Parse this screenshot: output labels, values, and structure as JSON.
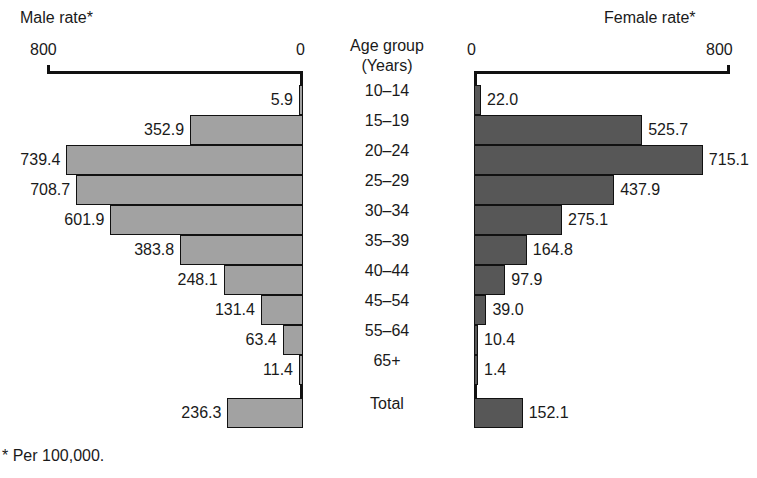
{
  "male_panel": {
    "title": "Male rate*",
    "axis_max_label": "800",
    "axis_zero_label": "0"
  },
  "female_panel": {
    "title": "Female rate*",
    "axis_zero_label": "0",
    "axis_max_label": "800"
  },
  "center": {
    "header_line1": "Age group",
    "header_line2": "(Years)"
  },
  "footnote": "* Per 100,000.",
  "colors": {
    "male_bar": "#a2a2a2",
    "female_bar": "#575757",
    "outline": "#111111",
    "text": "#1a1a1a"
  },
  "chart_data": {
    "type": "bar",
    "orientation": "horizontal",
    "layout": "population-pyramid / back-to-back bars",
    "xlabel": "Rate per 100,000",
    "ylabel": "Age group (Years)",
    "xlim": [
      0,
      800
    ],
    "axis_ticks": [
      0,
      800
    ],
    "grid": false,
    "legend": "none",
    "categories": [
      "10–14",
      "15–19",
      "20–24",
      "25–29",
      "30–34",
      "35–39",
      "40–44",
      "45–54",
      "55–64",
      "65+",
      "Total"
    ],
    "series": [
      {
        "name": "Male rate*",
        "side": "left",
        "color": "#a2a2a2",
        "values": [
          5.9,
          352.9,
          739.4,
          708.7,
          601.9,
          383.8,
          248.1,
          131.4,
          63.4,
          11.4,
          236.3
        ],
        "labels": [
          "5.9",
          "352.9",
          "739.4",
          "708.7",
          "601.9",
          "383.8",
          "248.1",
          "131.4",
          "63.4",
          "11.4",
          "236.3"
        ]
      },
      {
        "name": "Female rate*",
        "side": "right",
        "color": "#575757",
        "values": [
          22.0,
          525.7,
          715.1,
          437.9,
          275.1,
          164.8,
          97.9,
          39.0,
          10.4,
          1.4,
          152.1
        ],
        "labels": [
          "22.0",
          "525.7",
          "715.1",
          "437.9",
          "275.1",
          "164.8",
          "97.9",
          "39.0",
          "10.4",
          "1.4",
          "152.1"
        ]
      }
    ],
    "annotations": [
      "* Per 100,000."
    ]
  }
}
